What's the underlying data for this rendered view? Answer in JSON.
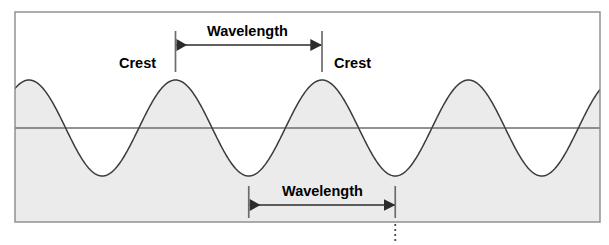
{
  "figure": {
    "title_visible": false,
    "background_color": "#ffffff",
    "frame": {
      "x": 15,
      "y": 12,
      "width": 585,
      "height": 210,
      "border_color": "#8a8a8a",
      "fill_color": "#ffffff"
    },
    "water_fill_color": "#ebebeb",
    "curve_color": "#3b3b3b",
    "midline_color": "#6e6e6e",
    "annotation_color": "#000000"
  },
  "chart_data": {
    "type": "line",
    "title": "",
    "xlabel": "",
    "ylabel": "",
    "grid": false,
    "legend": "none",
    "xlim": [
      15,
      600
    ],
    "ylim": [
      12,
      222
    ],
    "wave": {
      "form": "sine",
      "baseline_y": 128,
      "amplitude_px": 48,
      "period_px": 146.5,
      "first_crest_x": 29,
      "crest_x_positions": [
        29,
        175.5,
        322,
        468.5
      ],
      "trough_x_positions": [
        102.25,
        248.75,
        395.25,
        541.75
      ],
      "crest_y": 80,
      "trough_y": 176,
      "fill_side": "below-curve"
    },
    "measurements": [
      {
        "name": "wavelength-top",
        "label": "Wavelength",
        "from_feature": "crest",
        "to_feature": "crest",
        "x_start": 175.5,
        "x_end": 322,
        "length_px": 146.5,
        "arrow_y": 45,
        "tick_top_y": 31,
        "tick_bottom_y": 72
      },
      {
        "name": "wavelength-bottom",
        "label": "Wavelength",
        "from_feature": "trough",
        "to_feature": "trough",
        "x_start": 248.75,
        "x_end": 395.25,
        "length_px": 146.5,
        "arrow_y": 205,
        "tick_top_y": 186,
        "tick_bottom_y": 218
      }
    ],
    "reference_line": {
      "name": "trough-dropline",
      "style": "dotted",
      "x": 395.25,
      "y_start": 224,
      "y_end": 243
    }
  },
  "labels": {
    "crest_left": {
      "text": "Crest",
      "x": 119,
      "y": 56
    },
    "crest_right": {
      "text": "Crest",
      "x": 334,
      "y": 56
    },
    "wavelength_top": {
      "text": "Wavelength",
      "x": 207,
      "y": 24
    },
    "wavelength_bottom": {
      "text": "Wavelength",
      "x": 282,
      "y": 184
    }
  }
}
